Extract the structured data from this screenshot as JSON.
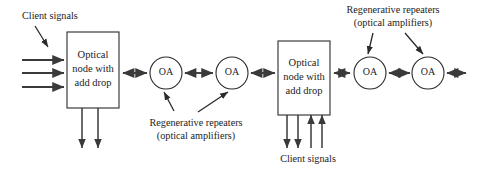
{
  "figure": {
    "background_color": "#ffffff",
    "line_color": "#3a3a3a",
    "stroke_color": "#2b2b2b",
    "text_color": "#1c1c1c",
    "width": 479,
    "height": 178
  },
  "nodes": {
    "left_node": {
      "line1": "Optical",
      "line2": "node with",
      "line3": "add drop"
    },
    "right_node": {
      "line1": "Optical",
      "line2": "node with",
      "line3": "add drop"
    }
  },
  "amplifiers": [
    {
      "id": "oa-1",
      "label": "OA"
    },
    {
      "id": "oa-2",
      "label": "OA"
    },
    {
      "id": "oa-3",
      "label": "OA"
    },
    {
      "id": "oa-4",
      "label": "OA"
    }
  ],
  "annotations": {
    "client_signals_top_left": "Client signals",
    "client_signals_bottom_right": "Client signals",
    "repeaters_center": {
      "line1": "Regenerative repeaters",
      "line2": "(optical amplifiers)"
    },
    "repeaters_top_right": {
      "line1": "Regenerative repeaters",
      "line2": "(optical amplifiers)"
    }
  }
}
